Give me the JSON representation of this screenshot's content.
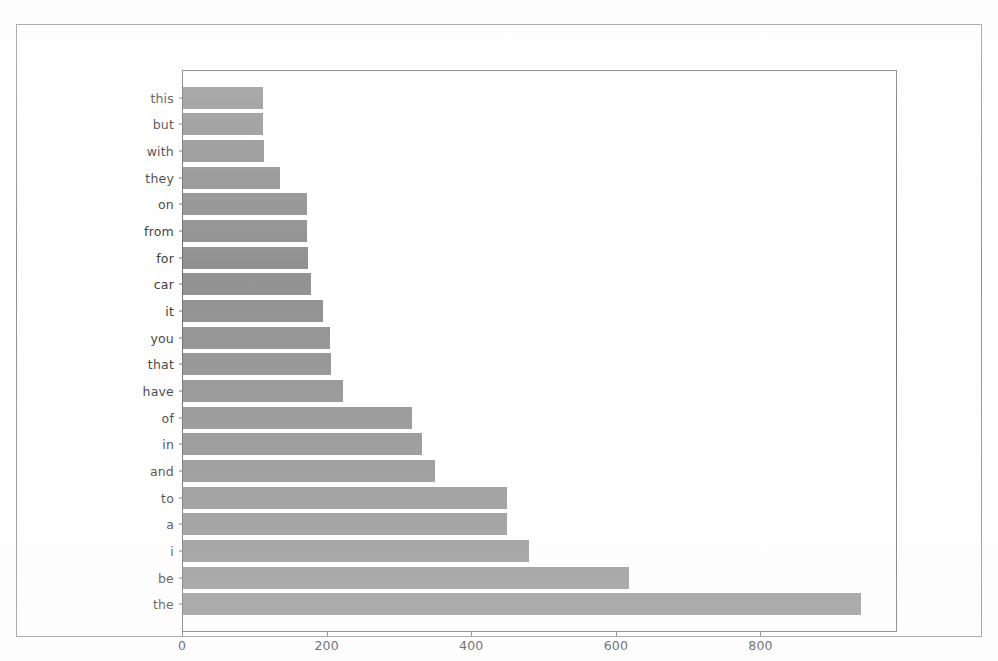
{
  "figure": {
    "background_color": "#ffffff",
    "bar_color": "#919191",
    "axis_color": "#6e6e6e",
    "page_border_color": "#8d8d8d"
  },
  "chart_data": {
    "type": "bar",
    "orientation": "horizontal",
    "title": "",
    "xlabel": "",
    "ylabel": "",
    "grid": false,
    "legend": null,
    "xlim": [
      0,
      986
    ],
    "xticks": [
      0,
      200,
      400,
      600,
      800
    ],
    "xtick_labels": [
      "0",
      "200",
      "400",
      "600",
      "800"
    ],
    "categories": [
      "this",
      "but",
      "with",
      "they",
      "on",
      "from",
      "for",
      "car",
      "it",
      "you",
      "that",
      "have",
      "of",
      "in",
      "and",
      "to",
      "a",
      "i",
      "be",
      "the"
    ],
    "values": [
      110,
      110,
      112,
      134,
      172,
      172,
      173,
      177,
      193,
      203,
      205,
      221,
      317,
      331,
      349,
      448,
      448,
      478,
      617,
      938
    ]
  }
}
